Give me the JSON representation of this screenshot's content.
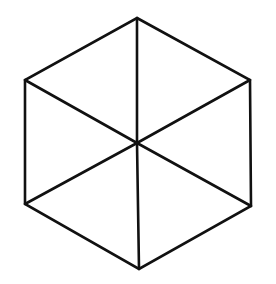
{
  "diagram": {
    "type": "hexagon-with-spokes",
    "background": "#ffffff",
    "stroke_color": "#111111",
    "stroke_width": 2.6,
    "center": {
      "x": 137,
      "y": 143
    },
    "vertices": [
      {
        "name": "top",
        "x": 137,
        "y": 18
      },
      {
        "name": "upper-right",
        "x": 250,
        "y": 80
      },
      {
        "name": "lower-right",
        "x": 251,
        "y": 206
      },
      {
        "name": "bottom",
        "x": 139,
        "y": 269
      },
      {
        "name": "lower-left",
        "x": 25,
        "y": 204
      },
      {
        "name": "upper-left",
        "x": 25,
        "y": 80
      }
    ]
  }
}
